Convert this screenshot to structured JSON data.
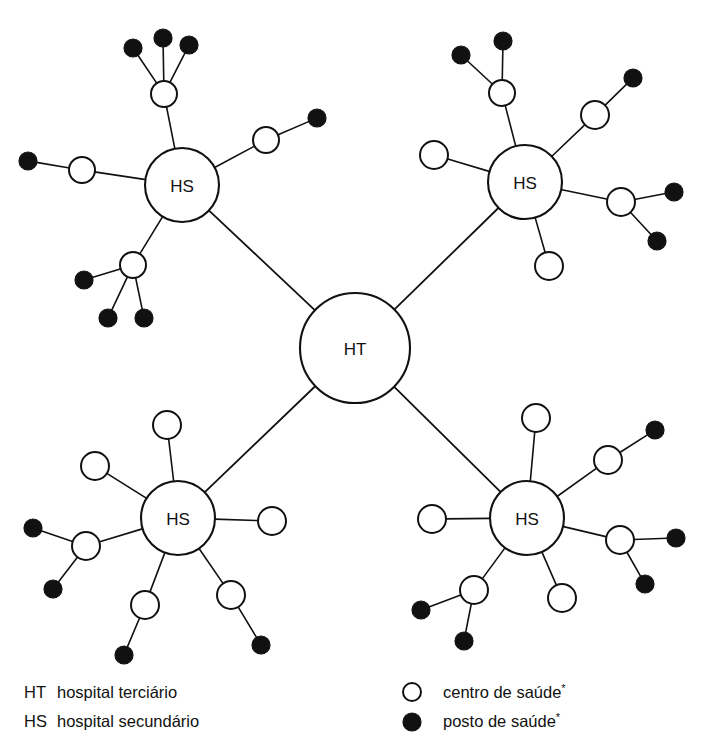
{
  "diagram": {
    "background_color": "#ffffff",
    "line_color": "#111111",
    "node_fill_open": "#ffffff",
    "node_fill_solid": "#111111",
    "hospital_tertiary_label": "HT",
    "hospital_secondary_label": "HS",
    "nodes": {
      "tertiary": {
        "label": "HT",
        "name": "hospital-terciario",
        "cx": 355,
        "cy": 348,
        "r": 55
      },
      "secondary": [
        {
          "label": "HS",
          "name": "hospital-secundario-noroeste",
          "cx": 182,
          "cy": 185,
          "r": 37
        },
        {
          "label": "HS",
          "name": "hospital-secundario-nordeste",
          "cx": 525,
          "cy": 182,
          "r": 37
        },
        {
          "label": "HS",
          "name": "hospital-secundario-sudoeste",
          "cx": 178,
          "cy": 518,
          "r": 37
        },
        {
          "label": "HS",
          "name": "hospital-secundario-sudeste",
          "cx": 527,
          "cy": 518,
          "r": 37
        }
      ],
      "centros": [
        {
          "name": "centro-saude-no-1",
          "cx": 164,
          "cy": 94,
          "r": 13
        },
        {
          "name": "centro-saude-no-2",
          "cx": 82,
          "cy": 170,
          "r": 13
        },
        {
          "name": "centro-saude-no-3",
          "cx": 266,
          "cy": 140,
          "r": 13
        },
        {
          "name": "centro-saude-no-4",
          "cx": 133,
          "cy": 265,
          "r": 13
        },
        {
          "name": "centro-saude-ne-1",
          "cx": 502,
          "cy": 93,
          "r": 13
        },
        {
          "name": "centro-saude-ne-2",
          "cx": 595,
          "cy": 115,
          "r": 14
        },
        {
          "name": "centro-saude-ne-3",
          "cx": 434,
          "cy": 155,
          "r": 14
        },
        {
          "name": "centro-saude-ne-4",
          "cx": 621,
          "cy": 202,
          "r": 14
        },
        {
          "name": "centro-saude-ne-5",
          "cx": 549,
          "cy": 266,
          "r": 14
        },
        {
          "name": "centro-saude-so-1",
          "cx": 167,
          "cy": 425,
          "r": 14
        },
        {
          "name": "centro-saude-so-2",
          "cx": 95,
          "cy": 466,
          "r": 14
        },
        {
          "name": "centro-saude-so-3",
          "cx": 86,
          "cy": 546,
          "r": 14
        },
        {
          "name": "centro-saude-so-4",
          "cx": 145,
          "cy": 605,
          "r": 14
        },
        {
          "name": "centro-saude-so-5",
          "cx": 231,
          "cy": 595,
          "r": 14
        },
        {
          "name": "centro-saude-so-6",
          "cx": 272,
          "cy": 521,
          "r": 14
        },
        {
          "name": "centro-saude-se-1",
          "cx": 536,
          "cy": 418,
          "r": 14
        },
        {
          "name": "centro-saude-se-2",
          "cx": 608,
          "cy": 460,
          "r": 14
        },
        {
          "name": "centro-saude-se-3",
          "cx": 620,
          "cy": 540,
          "r": 14
        },
        {
          "name": "centro-saude-se-4",
          "cx": 562,
          "cy": 598,
          "r": 14
        },
        {
          "name": "centro-saude-se-5",
          "cx": 474,
          "cy": 590,
          "r": 14
        },
        {
          "name": "centro-saude-se-6",
          "cx": 432,
          "cy": 519,
          "r": 14
        }
      ],
      "postos": [
        {
          "name": "posto-saude-no-1",
          "cx": 133,
          "cy": 48,
          "r": 9
        },
        {
          "name": "posto-saude-no-2",
          "cx": 163,
          "cy": 38,
          "r": 9
        },
        {
          "name": "posto-saude-no-3",
          "cx": 189,
          "cy": 45,
          "r": 9
        },
        {
          "name": "posto-saude-no-4",
          "cx": 28,
          "cy": 161,
          "r": 9
        },
        {
          "name": "posto-saude-no-5",
          "cx": 317,
          "cy": 118,
          "r": 9
        },
        {
          "name": "posto-saude-no-6",
          "cx": 84,
          "cy": 280,
          "r": 9
        },
        {
          "name": "posto-saude-no-7",
          "cx": 108,
          "cy": 318,
          "r": 9
        },
        {
          "name": "posto-saude-no-8",
          "cx": 144,
          "cy": 318,
          "r": 9
        },
        {
          "name": "posto-saude-ne-1",
          "cx": 461,
          "cy": 55,
          "r": 9
        },
        {
          "name": "posto-saude-ne-2",
          "cx": 503,
          "cy": 41,
          "r": 9
        },
        {
          "name": "posto-saude-ne-3",
          "cx": 633,
          "cy": 78,
          "r": 9
        },
        {
          "name": "posto-saude-ne-4",
          "cx": 674,
          "cy": 192,
          "r": 9
        },
        {
          "name": "posto-saude-ne-5",
          "cx": 657,
          "cy": 241,
          "r": 9
        },
        {
          "name": "posto-saude-so-1",
          "cx": 33,
          "cy": 528,
          "r": 9
        },
        {
          "name": "posto-saude-so-2",
          "cx": 53,
          "cy": 589,
          "r": 9
        },
        {
          "name": "posto-saude-so-3",
          "cx": 124,
          "cy": 655,
          "r": 9
        },
        {
          "name": "posto-saude-so-4",
          "cx": 261,
          "cy": 645,
          "r": 9
        },
        {
          "name": "posto-saude-se-1",
          "cx": 655,
          "cy": 430,
          "r": 9
        },
        {
          "name": "posto-saude-se-2",
          "cx": 676,
          "cy": 538,
          "r": 9
        },
        {
          "name": "posto-saude-se-3",
          "cx": 645,
          "cy": 584,
          "r": 9
        },
        {
          "name": "posto-saude-se-4",
          "cx": 421,
          "cy": 610,
          "r": 9
        },
        {
          "name": "posto-saude-se-5",
          "cx": 464,
          "cy": 641,
          "r": 9
        }
      ]
    },
    "edges": {
      "trunk": [
        {
          "name": "edge-ht-hs-noroeste",
          "from": "tertiary",
          "to": "hospital-secundario-noroeste"
        },
        {
          "name": "edge-ht-hs-nordeste",
          "from": "tertiary",
          "to": "hospital-secundario-nordeste"
        },
        {
          "name": "edge-ht-hs-sudoeste",
          "from": "tertiary",
          "to": "hospital-secundario-sudoeste"
        },
        {
          "name": "edge-ht-hs-sudeste",
          "from": "tertiary",
          "to": "hospital-secundario-sudeste"
        }
      ],
      "hs_to_centro": [
        [
          "hospital-secundario-noroeste",
          "centro-saude-no-1"
        ],
        [
          "hospital-secundario-noroeste",
          "centro-saude-no-2"
        ],
        [
          "hospital-secundario-noroeste",
          "centro-saude-no-3"
        ],
        [
          "hospital-secundario-noroeste",
          "centro-saude-no-4"
        ],
        [
          "hospital-secundario-nordeste",
          "centro-saude-ne-1"
        ],
        [
          "hospital-secundario-nordeste",
          "centro-saude-ne-2"
        ],
        [
          "hospital-secundario-nordeste",
          "centro-saude-ne-3"
        ],
        [
          "hospital-secundario-nordeste",
          "centro-saude-ne-4"
        ],
        [
          "hospital-secundario-nordeste",
          "centro-saude-ne-5"
        ],
        [
          "hospital-secundario-sudoeste",
          "centro-saude-so-1"
        ],
        [
          "hospital-secundario-sudoeste",
          "centro-saude-so-2"
        ],
        [
          "hospital-secundario-sudoeste",
          "centro-saude-so-3"
        ],
        [
          "hospital-secundario-sudoeste",
          "centro-saude-so-4"
        ],
        [
          "hospital-secundario-sudoeste",
          "centro-saude-so-5"
        ],
        [
          "hospital-secundario-sudoeste",
          "centro-saude-so-6"
        ],
        [
          "hospital-secundario-sudeste",
          "centro-saude-se-1"
        ],
        [
          "hospital-secundario-sudeste",
          "centro-saude-se-2"
        ],
        [
          "hospital-secundario-sudeste",
          "centro-saude-se-3"
        ],
        [
          "hospital-secundario-sudeste",
          "centro-saude-se-4"
        ],
        [
          "hospital-secundario-sudeste",
          "centro-saude-se-5"
        ],
        [
          "hospital-secundario-sudeste",
          "centro-saude-se-6"
        ]
      ],
      "centro_to_posto": [
        [
          "centro-saude-no-1",
          "posto-saude-no-1"
        ],
        [
          "centro-saude-no-1",
          "posto-saude-no-2"
        ],
        [
          "centro-saude-no-1",
          "posto-saude-no-3"
        ],
        [
          "centro-saude-no-2",
          "posto-saude-no-4"
        ],
        [
          "centro-saude-no-3",
          "posto-saude-no-5"
        ],
        [
          "centro-saude-no-4",
          "posto-saude-no-6"
        ],
        [
          "centro-saude-no-4",
          "posto-saude-no-7"
        ],
        [
          "centro-saude-no-4",
          "posto-saude-no-8"
        ],
        [
          "centro-saude-ne-1",
          "posto-saude-ne-1"
        ],
        [
          "centro-saude-ne-1",
          "posto-saude-ne-2"
        ],
        [
          "centro-saude-ne-2",
          "posto-saude-ne-3"
        ],
        [
          "centro-saude-ne-4",
          "posto-saude-ne-4"
        ],
        [
          "centro-saude-ne-4",
          "posto-saude-ne-5"
        ],
        [
          "centro-saude-so-3",
          "posto-saude-so-1"
        ],
        [
          "centro-saude-so-3",
          "posto-saude-so-2"
        ],
        [
          "centro-saude-so-4",
          "posto-saude-so-3"
        ],
        [
          "centro-saude-so-5",
          "posto-saude-so-4"
        ],
        [
          "centro-saude-se-2",
          "posto-saude-se-1"
        ],
        [
          "centro-saude-se-3",
          "posto-saude-se-2"
        ],
        [
          "centro-saude-se-3",
          "posto-saude-se-3"
        ],
        [
          "centro-saude-se-5",
          "posto-saude-se-4"
        ],
        [
          "centro-saude-se-5",
          "posto-saude-se-5"
        ]
      ]
    }
  },
  "legend": {
    "abbreviations": [
      {
        "code": "HT",
        "description": "hospital terciário"
      },
      {
        "code": "HS",
        "description": "hospital secundário"
      }
    ],
    "symbols": [
      {
        "marker": "open-circle-icon",
        "label": "centro de saúde",
        "note": "*"
      },
      {
        "marker": "filled-circle-icon",
        "label": "posto de saúde",
        "note": "*"
      }
    ]
  }
}
